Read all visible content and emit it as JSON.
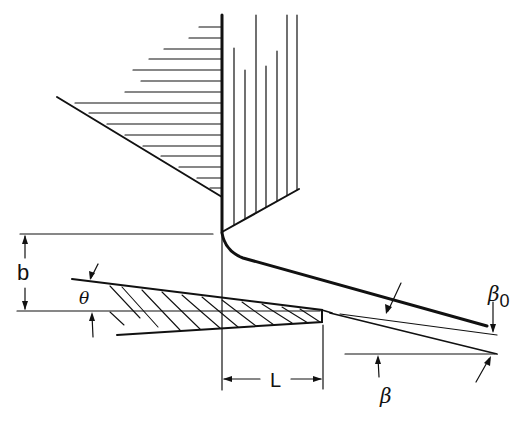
{
  "figure": {
    "type": "engineering-diagram"
  },
  "labels": {
    "b": "b",
    "theta": "θ",
    "beta0_symbol": "β",
    "beta0_subscript": "0",
    "beta": "β",
    "L": "L"
  },
  "colors": {
    "ink": "#111111",
    "background": "#ffffff"
  }
}
